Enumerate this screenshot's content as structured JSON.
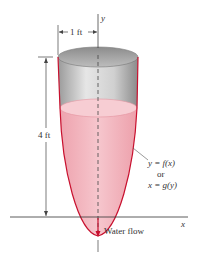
{
  "figure": {
    "axis_y_label": "y",
    "axis_x_label": "x",
    "width_dimension": "1 ft",
    "height_dimension": "4 ft",
    "curve_label_line1": "y = f(x)",
    "curve_label_line2": "or",
    "curve_label_line3": "x = g(y)",
    "outflow_label": "Water flow",
    "colors": {
      "water_fill": "#f2b7c0",
      "water_surface": "#f7cdd3",
      "tank_outline": "#c8102e",
      "tank_interior_gray": "#c8c8c8",
      "axis": "#333333"
    }
  }
}
